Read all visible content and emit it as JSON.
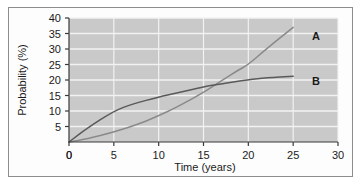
{
  "chart_data": {
    "type": "line",
    "title": "",
    "xlabel": "Time (years)",
    "ylabel": "Probability (%)",
    "xlim": [
      0,
      30
    ],
    "ylim": [
      0,
      40
    ],
    "xticks": [
      0,
      5,
      10,
      15,
      20,
      25,
      30
    ],
    "yticks": [
      0,
      5,
      10,
      15,
      20,
      25,
      30,
      35,
      40
    ],
    "grid": "horizontal-and-vertical",
    "legend": "inline-end-labels",
    "plot_background": "#c9c9c9",
    "gridline_color": "#f2f2f2",
    "series": [
      {
        "name": "A",
        "label": "A",
        "color": "#8a8a8a",
        "x": [
          0,
          2,
          5,
          8,
          10,
          12,
          15,
          17,
          19,
          20,
          22,
          25
        ],
        "values": [
          0,
          1.0,
          3.2,
          6.0,
          8.5,
          11.2,
          16.0,
          19.8,
          23.4,
          25.0,
          30.0,
          37.0
        ]
      },
      {
        "name": "B",
        "label": "B",
        "color": "#5a5a5a",
        "x": [
          0,
          2,
          5,
          7,
          10,
          12,
          15,
          17,
          20,
          22,
          25
        ],
        "values": [
          0,
          4.4,
          10.0,
          12.2,
          14.5,
          15.8,
          17.8,
          18.8,
          20.1,
          20.7,
          21.2
        ]
      }
    ],
    "crossing_point": {
      "x": 15.5,
      "y": 18.0
    }
  },
  "axis": {
    "x_tick_labels": [
      "0",
      "5",
      "10",
      "15",
      "20",
      "25",
      "30"
    ],
    "y_tick_labels": [
      "0",
      "5",
      "10",
      "15",
      "20",
      "25",
      "30",
      "35",
      "40"
    ],
    "x_title": "Time (years)",
    "y_title": "Probability (%)"
  },
  "series_labels": {
    "a": "A",
    "b": "B"
  }
}
